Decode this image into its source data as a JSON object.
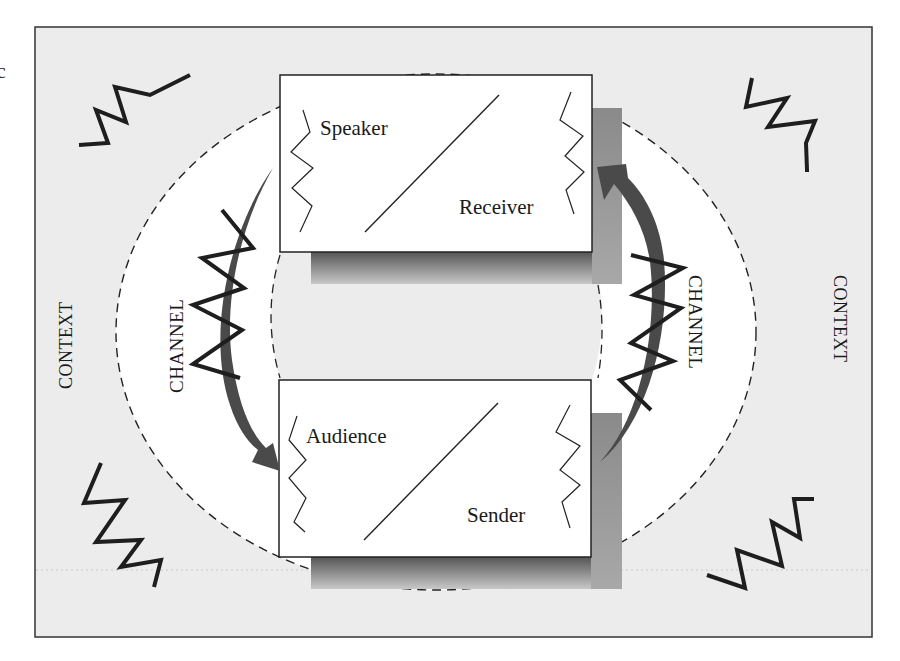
{
  "diagram": {
    "type": "communication-model",
    "stray_text": "c",
    "context_labels": {
      "left": "CONTEXT",
      "right": "CONTEXT"
    },
    "channel_labels": {
      "left": "CHANNEL",
      "right": "CHANNEL"
    },
    "boxes": {
      "top": {
        "top_left_label": "Speaker",
        "bottom_right_label": "Receiver"
      },
      "bottom": {
        "top_left_label": "Audience",
        "bottom_right_label": "Sender"
      }
    },
    "arrows": [
      {
        "from": "top-box",
        "to": "bottom-box",
        "side": "left",
        "label": "CHANNEL"
      },
      {
        "from": "bottom-box",
        "to": "top-box",
        "side": "right",
        "label": "CHANNEL"
      }
    ],
    "colors": {
      "background": "#ececec",
      "inner": "#ffffff",
      "arrow": "#4a4a4a",
      "noise": "#1e1e1e",
      "border": "#333333"
    }
  }
}
